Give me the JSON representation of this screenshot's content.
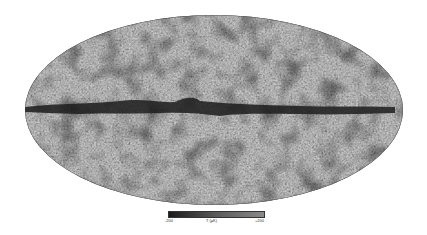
{
  "map": {
    "projection": "mollweide",
    "description": "All-sky temperature map with dark galactic plane band",
    "background_color": "#4a4a4a",
    "band_color": "#1f1f1f",
    "noise_light": "#6e6e6e",
    "noise_dark": "#2a2a2a"
  },
  "colorbar": {
    "min_label": "-200",
    "max_label": "+200",
    "unit_label": "T (μK)",
    "color_low": "#1a1a1a",
    "color_mid": "#5a5a5a",
    "color_high": "#8a8a8a"
  }
}
